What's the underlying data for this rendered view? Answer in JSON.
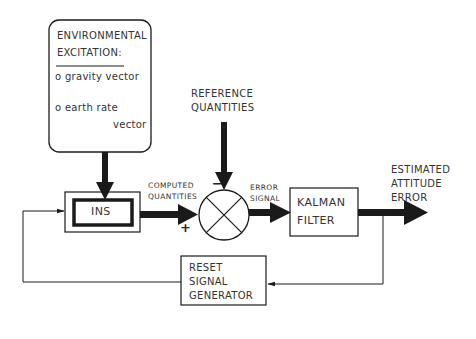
{
  "diagram": {
    "type": "block-diagram",
    "title": "",
    "env_box": {
      "heading_line1": "ENVIRONMENTAL",
      "heading_line2": "EXCITATION:",
      "items": [
        {
          "bullet": "o",
          "text": "gravity vector"
        },
        {
          "bullet": "o",
          "text": "earth rate",
          "text2": "vector"
        }
      ]
    },
    "reference": {
      "line1": "REFERENCE",
      "line2": "QUANTITIES"
    },
    "ins": {
      "label": "INS"
    },
    "computed": {
      "line1": "COMPUTED",
      "line2": "QUANTITIES"
    },
    "junction": {
      "minus_sign": "−",
      "plus_sign": "+"
    },
    "error_signal": {
      "line1": "ERROR",
      "line2": "SIGNAL"
    },
    "kalman": {
      "line1": "KALMAN",
      "line2": "FILTER"
    },
    "output": {
      "line1": "ESTIMATED",
      "line2": "ATTITUDE",
      "line3": "ERROR"
    },
    "reset": {
      "line1": "RESET",
      "line2": "SIGNAL",
      "line3": "GENERATOR"
    },
    "colors": {
      "stroke": "#1a1a1a",
      "text": "#333333",
      "background": "#ffffff"
    }
  }
}
